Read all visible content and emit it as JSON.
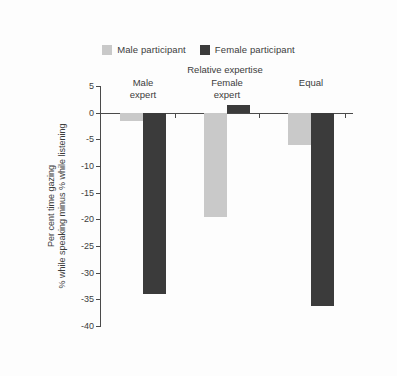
{
  "chart_data": {
    "type": "bar",
    "title": "",
    "group_axis_title": "Relative expertise",
    "categories": [
      "Male\nexpert",
      "Female\nexpert",
      "Equal"
    ],
    "category_lines": [
      [
        "Male",
        "expert"
      ],
      [
        "Female",
        "expert"
      ],
      [
        "Equal"
      ]
    ],
    "series": [
      {
        "name": "Male participant",
        "color": "#c9c9c9",
        "values": [
          -1.5,
          -19.5,
          -6.0
        ]
      },
      {
        "name": "Female participant",
        "color": "#3b3b3b",
        "values": [
          -34.0,
          1.5,
          -36.3
        ]
      }
    ],
    "xlabel": "Relative expertise",
    "ylabel": "Per cent time gazing % while speaking minus % while listening",
    "ylabel_lines": [
      "Per cent time gazing",
      "% while speaking minus % while listening"
    ],
    "ylim": [
      -40,
      5
    ],
    "yticks": [
      5,
      0,
      -5,
      -10,
      -15,
      -20,
      -25,
      -30,
      -35,
      -40
    ],
    "ytick_labels": [
      "5",
      "0",
      "-5",
      "-10",
      "-15",
      "-20",
      "-25",
      "-30",
      "-35",
      "-40"
    ],
    "grid": false,
    "legend_position": "top-center"
  },
  "legend": {
    "entries": [
      {
        "label": "Male participant",
        "color": "#c9c9c9"
      },
      {
        "label": "Female participant",
        "color": "#3b3b3b"
      }
    ]
  },
  "colors": {
    "male": "#c9c9c9",
    "female": "#3b3b3b",
    "axis": "#4a4a4a",
    "text": "#3c3c3c",
    "background": "#fdfdfd"
  }
}
